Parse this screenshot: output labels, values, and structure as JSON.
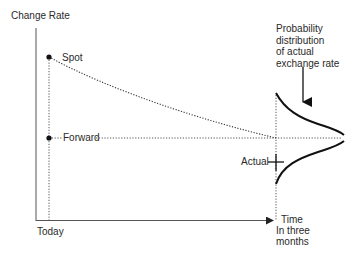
{
  "diagram": {
    "y_axis_label": "Change Rate",
    "x_axis_label": "Time",
    "x_start_label": "Today",
    "x_end_label": "In three months",
    "x_end_label_lines": [
      "In three",
      "months"
    ],
    "spot_label": "Spot",
    "forward_label": "Forward",
    "actual_label": "Actual",
    "distribution_label": "Probability distribution of actual exchange rate",
    "distribution_label_lines": [
      "Probability",
      "distribution",
      "of actual",
      "exchange rate"
    ]
  },
  "colors": {
    "axis": "#444444",
    "curve": "#111111",
    "dotted": "#555555",
    "text": "#2a2a2a"
  }
}
